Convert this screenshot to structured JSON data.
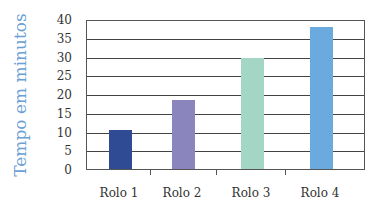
{
  "chart_data": {
    "type": "bar",
    "title": "",
    "xlabel": "",
    "ylabel": "Tempo em minutos",
    "categories": [
      "Rolo 1",
      "Rolo 2",
      "Rolo 3",
      "Rolo 4"
    ],
    "values": [
      10.5,
      18.5,
      29.5,
      38
    ],
    "colors": [
      "#2e4b94",
      "#8a86bd",
      "#a3d6c4",
      "#6aaadf"
    ],
    "ylim": [
      0,
      40
    ],
    "yticks": [
      0,
      5,
      10,
      15,
      20,
      25,
      30,
      35,
      40
    ],
    "grid": true,
    "legend": null
  }
}
